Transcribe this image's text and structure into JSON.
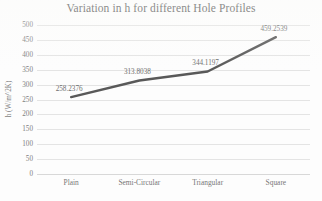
{
  "chart_data": {
    "type": "line",
    "title": "Variation in h for different Hole Profiles",
    "xlabel": "",
    "ylabel": "h (W/m^2K)",
    "categories": [
      "Plain",
      "Semi-Circular",
      "Triangular",
      "Square"
    ],
    "values": [
      258.2376,
      313.8038,
      344.1197,
      459.2539
    ],
    "data_labels": [
      "258.2376",
      "313.8038",
      "344.1197",
      "459.2539"
    ],
    "ylim": [
      0,
      500
    ],
    "ytick_step": 50,
    "yticks": [
      "0",
      "50",
      "100",
      "150",
      "200",
      "250",
      "300",
      "350",
      "400",
      "450",
      "500"
    ],
    "grid": "horizontal",
    "legend": "none",
    "series": [
      {
        "name": "h",
        "values": [
          258.2376,
          313.8038,
          344.1197,
          459.2539
        ],
        "color": "#595959",
        "marker": "none",
        "line_width": 2.4
      }
    ]
  },
  "colors": {
    "line": "#595959",
    "gridline": "#e4e4e4",
    "title_text": "#595959",
    "tick_text": "#808080",
    "background": "#fdfdfd"
  }
}
